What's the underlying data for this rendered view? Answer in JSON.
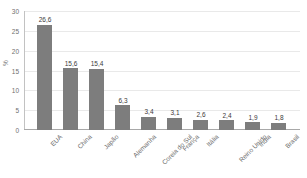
{
  "chart_data": {
    "type": "bar",
    "title": "",
    "xlabel": "",
    "ylabel": "%",
    "ylim": [
      0,
      30
    ],
    "ytick_labels": [
      "30",
      "25",
      "20",
      "15",
      "10",
      "5",
      "0"
    ],
    "ytick_values": [
      30,
      25,
      20,
      15,
      10,
      5,
      0
    ],
    "grid": true,
    "legend": "none",
    "bar_color": "#7d7d7d",
    "categories": [
      "EUA",
      "China",
      "Japão",
      "Alemanha",
      "Coreia do Sul",
      "França",
      "Itália",
      "Reino Unido",
      "Índia",
      "Brasil"
    ],
    "values": [
      26.6,
      15.6,
      15.4,
      6.3,
      3.4,
      3.1,
      2.6,
      2.4,
      1.9,
      1.8
    ],
    "value_labels": [
      "26,6",
      "15,6",
      "15,4",
      "6,3",
      "3,4",
      "3,1",
      "2,6",
      "2,4",
      "1,9",
      "1,8"
    ]
  }
}
